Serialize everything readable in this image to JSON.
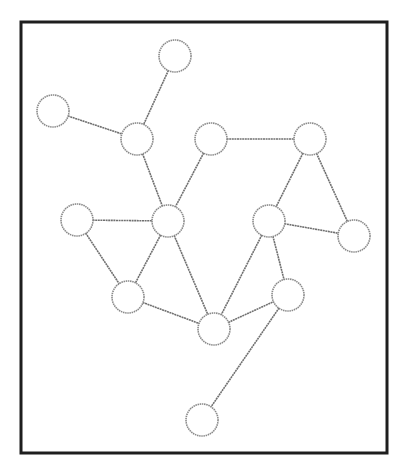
{
  "diagram": {
    "type": "undirected-graph",
    "frame": {
      "x": 21,
      "y": 22,
      "width": 366,
      "height": 431
    },
    "node_radius": 16,
    "nodes": [
      {
        "id": "A",
        "x": 175,
        "y": 56
      },
      {
        "id": "B",
        "x": 53,
        "y": 111
      },
      {
        "id": "C",
        "x": 137,
        "y": 139
      },
      {
        "id": "D",
        "x": 211,
        "y": 139
      },
      {
        "id": "E",
        "x": 310,
        "y": 139
      },
      {
        "id": "F",
        "x": 77,
        "y": 220
      },
      {
        "id": "G",
        "x": 168,
        "y": 221
      },
      {
        "id": "H",
        "x": 269,
        "y": 221
      },
      {
        "id": "I",
        "x": 354,
        "y": 236
      },
      {
        "id": "J",
        "x": 128,
        "y": 297
      },
      {
        "id": "K",
        "x": 214,
        "y": 329
      },
      {
        "id": "L",
        "x": 288,
        "y": 295
      },
      {
        "id": "M",
        "x": 202,
        "y": 420
      }
    ],
    "edges": [
      [
        "A",
        "C"
      ],
      [
        "B",
        "C"
      ],
      [
        "C",
        "G"
      ],
      [
        "D",
        "G"
      ],
      [
        "D",
        "E"
      ],
      [
        "E",
        "H"
      ],
      [
        "E",
        "I"
      ],
      [
        "H",
        "I"
      ],
      [
        "F",
        "G"
      ],
      [
        "F",
        "J"
      ],
      [
        "G",
        "J"
      ],
      [
        "G",
        "K"
      ],
      [
        "J",
        "K"
      ],
      [
        "H",
        "K"
      ],
      [
        "H",
        "L"
      ],
      [
        "K",
        "L"
      ],
      [
        "L",
        "M"
      ]
    ]
  }
}
